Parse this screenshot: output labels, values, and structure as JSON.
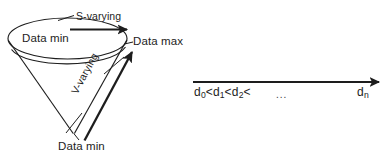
{
  "figure": {
    "background_color": "#ffffff",
    "stroke_color": "#1d1d1d",
    "cone_diagram": {
      "label_data_min_top": "Data min",
      "label_data_max": "Data max",
      "label_data_min_bottom": "Data min",
      "label_s_varying": "S-varying",
      "label_v_varying": "V-varying"
    },
    "axis_diagram": {
      "sequence_prefix": "d",
      "sequence_text": "d0<d1<d2<",
      "sequence_parts": [
        "d",
        "0",
        "<d",
        "1",
        "<d",
        "2",
        "<"
      ],
      "ellipsis": "...",
      "last_term": "dn",
      "last_term_base": "d",
      "last_term_sub": "n"
    }
  }
}
